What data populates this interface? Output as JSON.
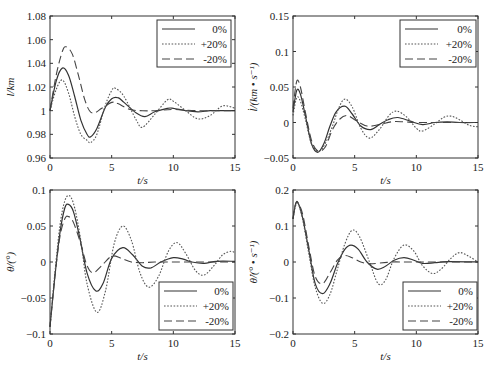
{
  "chart_data": [
    {
      "id": "l",
      "type": "line",
      "title": "",
      "xlabel": "t/s",
      "ylabel": "l/km",
      "xlim": [
        0,
        15
      ],
      "ylim": [
        0.96,
        1.08
      ],
      "xticks": [
        0,
        5,
        10,
        15
      ],
      "xtick_labels": [
        "0",
        "5",
        "10",
        "15"
      ],
      "yticks": [
        0.96,
        0.98,
        1.0,
        1.02,
        1.04,
        1.06,
        1.08
      ],
      "ytick_labels": [
        "0.96",
        "0.98",
        "1",
        "1.02",
        "1.04",
        "1.06",
        "1.08"
      ],
      "legend_position": "upper right",
      "box": {
        "x": 50,
        "y": 16,
        "w": 185,
        "h": 142
      },
      "legend_box": {
        "x": 157,
        "y": 20,
        "w": 74,
        "h": 47
      },
      "series": [
        {
          "name": "0%",
          "style": "solid",
          "x": [
            0,
            0.5,
            1.0,
            1.5,
            2.0,
            2.5,
            3.0,
            3.3,
            3.8,
            4.5,
            5.0,
            5.5,
            6.0,
            7.0,
            7.7,
            8.5,
            9.5,
            10.0,
            11.0,
            12.0,
            13.0,
            14.0,
            15.0
          ],
          "values": [
            1.0,
            1.025,
            1.036,
            1.03,
            1.012,
            0.992,
            0.98,
            0.978,
            0.985,
            1.003,
            1.01,
            1.011,
            1.007,
            0.998,
            0.995,
            0.999,
            1.002,
            1.002,
            1.0,
            0.999,
            1.0,
            1.0,
            1.0
          ]
        },
        {
          "name": "+20%",
          "style": "dotted",
          "x": [
            0,
            0.5,
            1.0,
            1.5,
            2.0,
            2.5,
            3.0,
            3.3,
            3.8,
            4.5,
            5.0,
            5.3,
            6.0,
            7.0,
            7.5,
            8.5,
            9.5,
            10.0,
            11.0,
            12.0,
            13.0,
            14.0,
            15.0
          ],
          "values": [
            1.0,
            1.018,
            1.026,
            1.015,
            0.995,
            0.98,
            0.975,
            0.973,
            0.98,
            1.005,
            1.017,
            1.019,
            1.012,
            0.992,
            0.986,
            0.997,
            1.009,
            1.008,
            1.0,
            0.993,
            0.996,
            1.004,
            1.002
          ]
        },
        {
          "name": "-20%",
          "style": "dashed",
          "x": [
            0,
            0.5,
            1.0,
            1.3,
            1.8,
            2.3,
            2.8,
            3.2,
            3.6,
            4.2,
            5.0,
            5.5,
            6.5,
            7.5,
            8.5,
            10.0,
            12.0,
            15.0
          ],
          "values": [
            1.0,
            1.03,
            1.05,
            1.054,
            1.048,
            1.03,
            1.01,
            1.0,
            0.998,
            1.002,
            1.007,
            1.006,
            1.001,
            1.0,
            1.0,
            1.001,
            1.0,
            1.0
          ]
        }
      ]
    },
    {
      "id": "l_dot",
      "type": "line",
      "title": "",
      "xlabel": "t/s",
      "ylabel": "l̇/(km • s⁻¹)",
      "xlim": [
        0,
        15
      ],
      "ylim": [
        -0.05,
        0.15
      ],
      "xticks": [
        0,
        5,
        10,
        15
      ],
      "xtick_labels": [
        "0",
        "5",
        "10",
        "15"
      ],
      "yticks": [
        -0.05,
        0,
        0.05,
        0.1,
        0.15
      ],
      "ytick_labels": [
        "−0.05",
        "0",
        "0.05",
        "0.1",
        "0.15"
      ],
      "legend_position": "upper right",
      "box": {
        "x": 293,
        "y": 16,
        "w": 185,
        "h": 142
      },
      "legend_box": {
        "x": 400,
        "y": 20,
        "w": 76,
        "h": 47
      },
      "series": [
        {
          "name": "0%",
          "style": "solid",
          "x": [
            0,
            0.3,
            0.6,
            1.0,
            1.5,
            2.0,
            2.5,
            3.0,
            3.5,
            4.2,
            4.8,
            5.5,
            6.3,
            7.0,
            7.7,
            8.5,
            9.5,
            10.5,
            11.5,
            12.5,
            13.5,
            15.0
          ],
          "values": [
            0.015,
            0.045,
            0.04,
            0.01,
            -0.03,
            -0.042,
            -0.03,
            -0.005,
            0.015,
            0.023,
            0.012,
            -0.005,
            -0.01,
            -0.003,
            0.004,
            0.007,
            0.002,
            -0.003,
            0.0,
            0.001,
            0.0,
            0.0
          ]
        },
        {
          "name": "+20%",
          "style": "dotted",
          "x": [
            0,
            0.3,
            0.6,
            1.0,
            1.5,
            2.1,
            2.6,
            3.2,
            3.7,
            4.2,
            4.8,
            5.5,
            6.2,
            7.0,
            7.8,
            8.4,
            9.2,
            10.0,
            10.5,
            11.5,
            12.2,
            12.8,
            13.5,
            14.3,
            15.0
          ],
          "values": [
            0.01,
            0.035,
            0.03,
            0.005,
            -0.03,
            -0.04,
            -0.03,
            -0.005,
            0.02,
            0.033,
            0.022,
            -0.008,
            -0.022,
            -0.01,
            0.01,
            0.016,
            0.008,
            -0.008,
            -0.012,
            -0.002,
            0.007,
            0.009,
            0.004,
            -0.004,
            -0.006
          ]
        },
        {
          "name": "-20%",
          "style": "dashed",
          "x": [
            0,
            0.3,
            0.6,
            1.0,
            1.5,
            2.0,
            2.6,
            3.2,
            3.8,
            4.4,
            5.0,
            6.0,
            7.0,
            8.0,
            9.0,
            10.0,
            12.0,
            15.0
          ],
          "values": [
            0.02,
            0.058,
            0.05,
            0.015,
            -0.025,
            -0.04,
            -0.035,
            -0.01,
            0.005,
            0.01,
            0.004,
            -0.005,
            -0.003,
            0.001,
            0.001,
            0.0,
            0.0,
            0.0
          ]
        }
      ]
    },
    {
      "id": "theta",
      "type": "line",
      "title": "",
      "xlabel": "t/s",
      "ylabel": "θ/(°)",
      "xlim": [
        0,
        15
      ],
      "ylim": [
        -0.1,
        0.1
      ],
      "xticks": [
        0,
        5,
        10,
        15
      ],
      "xtick_labels": [
        "0",
        "5",
        "10",
        "15"
      ],
      "yticks": [
        -0.1,
        -0.05,
        0,
        0.05,
        0.1
      ],
      "ytick_labels": [
        "−0.1",
        "−0.05",
        "0",
        "0.05",
        "0.1"
      ],
      "legend_position": "lower right",
      "box": {
        "x": 50,
        "y": 190,
        "w": 185,
        "h": 144
      },
      "legend_box": {
        "x": 159,
        "y": 282,
        "w": 74,
        "h": 48
      },
      "series": [
        {
          "name": "0%",
          "style": "solid",
          "x": [
            0,
            0.4,
            0.8,
            1.2,
            1.5,
            1.9,
            2.4,
            3.0,
            3.7,
            4.3,
            5.0,
            5.9,
            6.7,
            7.5,
            8.2,
            9.0,
            10.0,
            10.8,
            11.5,
            12.5,
            13.5,
            15.0
          ],
          "values": [
            -0.09,
            -0.02,
            0.04,
            0.075,
            0.08,
            0.07,
            0.035,
            -0.015,
            -0.04,
            -0.03,
            0.005,
            0.02,
            0.01,
            -0.006,
            -0.008,
            0.0,
            0.006,
            0.004,
            0.0,
            -0.002,
            0.001,
            0.001
          ]
        },
        {
          "name": "+20%",
          "style": "dotted",
          "x": [
            0,
            0.4,
            0.8,
            1.2,
            1.6,
            2.0,
            2.5,
            3.0,
            3.8,
            4.5,
            5.2,
            5.9,
            6.6,
            7.3,
            8.0,
            8.8,
            9.6,
            10.3,
            11.0,
            11.8,
            12.5,
            13.3,
            14.0,
            14.7,
            15.0
          ],
          "values": [
            -0.09,
            -0.015,
            0.05,
            0.085,
            0.092,
            0.075,
            0.03,
            -0.03,
            -0.07,
            -0.04,
            0.025,
            0.05,
            0.03,
            -0.015,
            -0.035,
            -0.02,
            0.015,
            0.027,
            0.012,
            -0.012,
            -0.018,
            -0.005,
            0.01,
            0.015,
            0.012
          ]
        },
        {
          "name": "-20%",
          "style": "dashed",
          "x": [
            0,
            0.4,
            0.8,
            1.2,
            1.5,
            1.9,
            2.5,
            3.0,
            3.5,
            4.2,
            5.0,
            5.8,
            6.6,
            7.5,
            8.5,
            10.0,
            12.0,
            15.0
          ],
          "values": [
            -0.09,
            -0.02,
            0.035,
            0.06,
            0.063,
            0.055,
            0.025,
            -0.005,
            -0.015,
            -0.005,
            0.008,
            0.005,
            0.0,
            -0.001,
            0.0,
            0.0,
            0.0,
            0.0
          ]
        }
      ]
    },
    {
      "id": "theta_dot",
      "type": "line",
      "title": "",
      "xlabel": "t/s",
      "ylabel": "θ̇/(° • s⁻¹)",
      "xlim": [
        0,
        15
      ],
      "ylim": [
        -0.2,
        0.2
      ],
      "xticks": [
        0,
        5,
        10,
        15
      ],
      "xtick_labels": [
        "0",
        "5",
        "10",
        "15"
      ],
      "yticks": [
        -0.2,
        -0.1,
        0,
        0.1,
        0.2
      ],
      "ytick_labels": [
        "−0.2",
        "−0.1",
        "0",
        "0.1",
        "0.2"
      ],
      "legend_position": "lower right",
      "box": {
        "x": 293,
        "y": 190,
        "w": 185,
        "h": 144
      },
      "legend_box": {
        "x": 403,
        "y": 282,
        "w": 74,
        "h": 48
      },
      "series": [
        {
          "name": "0%",
          "style": "solid",
          "x": [
            0,
            0.2,
            0.4,
            0.8,
            1.3,
            1.8,
            2.4,
            3.0,
            3.6,
            4.2,
            4.7,
            5.3,
            6.0,
            6.8,
            7.5,
            8.2,
            9.0,
            9.8,
            10.5,
            11.5,
            12.5,
            15.0
          ],
          "values": [
            0.12,
            0.16,
            0.165,
            0.12,
            0.03,
            -0.06,
            -0.088,
            -0.06,
            -0.005,
            0.035,
            0.047,
            0.035,
            0.0,
            -0.02,
            -0.012,
            0.005,
            0.012,
            0.005,
            -0.004,
            -0.002,
            0.001,
            0.0
          ]
        },
        {
          "name": "+20%",
          "style": "dotted",
          "x": [
            0,
            0.2,
            0.4,
            0.8,
            1.3,
            1.8,
            2.4,
            3.0,
            3.6,
            4.2,
            4.8,
            5.4,
            6.2,
            6.9,
            7.5,
            8.2,
            9.0,
            9.8,
            10.5,
            11.3,
            12.0,
            12.8,
            13.5,
            14.3,
            15.0
          ],
          "values": [
            0.12,
            0.155,
            0.165,
            0.115,
            0.02,
            -0.07,
            -0.115,
            -0.09,
            -0.02,
            0.05,
            0.088,
            0.07,
            0.0,
            -0.06,
            -0.05,
            0.01,
            0.047,
            0.03,
            -0.01,
            -0.032,
            -0.02,
            0.01,
            0.026,
            0.015,
            0.0
          ]
        },
        {
          "name": "-20%",
          "style": "dashed",
          "x": [
            0,
            0.2,
            0.4,
            0.8,
            1.3,
            1.8,
            2.4,
            3.0,
            3.6,
            4.2,
            4.8,
            5.5,
            6.2,
            7.0,
            8.0,
            9.0,
            10.0,
            12.0,
            15.0
          ],
          "values": [
            0.12,
            0.16,
            0.165,
            0.13,
            0.04,
            -0.04,
            -0.06,
            -0.03,
            0.005,
            0.018,
            0.012,
            0.0,
            -0.005,
            -0.003,
            0.0,
            0.0,
            0.0,
            0.0,
            0.0
          ]
        }
      ]
    }
  ]
}
